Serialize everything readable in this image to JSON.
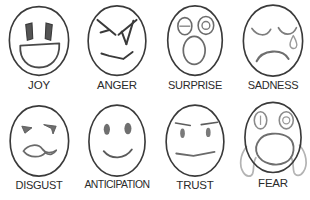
{
  "image": {
    "kind": "emotion-faces-chart",
    "columns": 4,
    "rows": 2,
    "background_color": "#ffffff",
    "line_color": "#3a3a3a",
    "soft_line_color": "#8f8f8f",
    "label_color": "#2b2b2b"
  },
  "faces": [
    {
      "id": "joy",
      "label": "JOY",
      "features": "wide open smile, two vertical rectangular eyes, egg-shaped head"
    },
    {
      "id": "anger",
      "label": "ANGER",
      "features": "angled v-shaped brows over slit eyes, downturned angular mouth"
    },
    {
      "id": "surprise",
      "label": "SURPRISE",
      "features": "two wide oval eyes with pupils, large open oval mouth"
    },
    {
      "id": "sadness",
      "label": "SADNESS",
      "features": "closed downward-arc eyes, teardrop on right cheek, deep frown"
    },
    {
      "id": "disgust",
      "label": "DISGUST",
      "features": "narrowed slanted eyes, wrinkled sneering mouth"
    },
    {
      "id": "anticipation",
      "label": "ANTICIPATION",
      "features": "two small oval eyes, gentle upward smile"
    },
    {
      "id": "trust",
      "label": "TRUST",
      "features": "straight raised eyebrows, small eyes, flat neutral mouth"
    },
    {
      "id": "fear",
      "label": "FEAR",
      "features": "wide oval eyes with pupils, large screaming mouth, hands raised on both cheeks"
    }
  ]
}
